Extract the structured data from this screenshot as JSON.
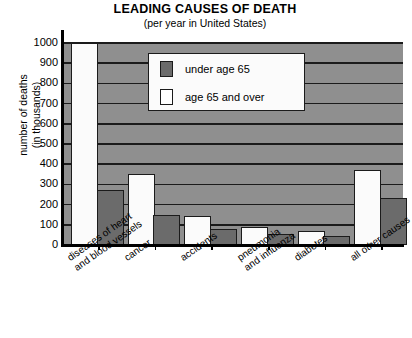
{
  "chart_data": {
    "type": "bar",
    "title": "LEADING CAUSES OF DEATH",
    "subtitle": "(per year in United States)",
    "xlabel": "",
    "ylabel_line1": "number of deaths",
    "ylabel_line2": "(in thousands)",
    "ylim": [
      0,
      1000
    ],
    "ytick_step": 100,
    "yticks": [
      "1000",
      "900",
      "800",
      "700",
      "600",
      "500",
      "400",
      "300",
      "200",
      "100",
      "0"
    ],
    "grid": true,
    "legend_position": "upper center",
    "categories": [
      "diseases of heart\nand blood vessels",
      "cancer",
      "accidents",
      "pneumonia\nand influenza",
      "diabetes",
      "all other causes"
    ],
    "category_lines": [
      [
        "diseases of heart",
        "and blood vessels"
      ],
      [
        "cancer"
      ],
      [
        "accidents"
      ],
      [
        "pneumonia",
        "and influenza"
      ],
      [
        "diabetes"
      ],
      [
        "all other causes"
      ]
    ],
    "series": [
      {
        "name": "age 65 and over",
        "color": "#ffffff",
        "values": [
          1030,
          350,
          145,
          90,
          70,
          370
        ]
      },
      {
        "name": "under age 65",
        "color": "#6b6b6b",
        "values": [
          270,
          150,
          80,
          55,
          45,
          235
        ]
      }
    ],
    "series_draw_order": [
      "age 65 and over",
      "under age 65"
    ],
    "plot_background": "#8f8f8f",
    "gridline_color": "#1b1b1b",
    "axis_color": "#000000"
  },
  "legend": {
    "items": [
      {
        "label": "under age 65",
        "swatch": "under"
      },
      {
        "label": "age 65 and over",
        "swatch": "over"
      }
    ]
  }
}
